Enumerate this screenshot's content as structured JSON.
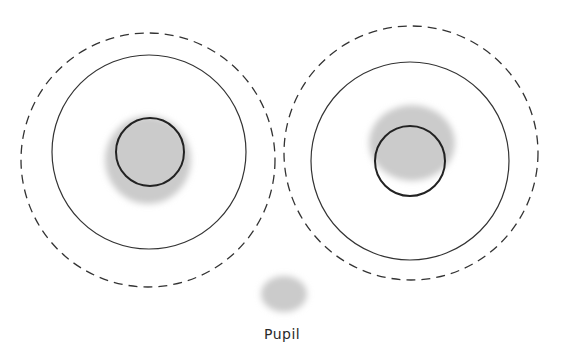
{
  "diagram": {
    "type": "eye-fixation-diagram",
    "colors": {
      "line": "#2a2a2a",
      "shade": "#c9c9c9",
      "background": "#ffffff"
    },
    "left_eye": {
      "dashed_circle": {
        "cx": 148,
        "cy": 160,
        "r": 127
      },
      "solid_circle": {
        "cx": 149,
        "cy": 152,
        "r": 97
      },
      "inner_circle": {
        "cx": 150,
        "cy": 152,
        "r": 34
      },
      "shaded_blob": {
        "cx": 148,
        "cy": 160,
        "rx": 43,
        "ry": 44
      }
    },
    "right_eye": {
      "dashed_circle": {
        "cx": 411,
        "cy": 153,
        "r": 127
      },
      "solid_circle": {
        "cx": 410,
        "cy": 161,
        "r": 99
      },
      "inner_circle": {
        "cx": 410,
        "cy": 161,
        "r": 35
      },
      "shaded_blob": {
        "cx": 412,
        "cy": 143,
        "rx": 43,
        "ry": 38
      }
    },
    "pupil_sample": {
      "cx": 284,
      "cy": 294,
      "rx": 23,
      "ry": 18
    },
    "labels": {
      "pupil": "Pupil"
    }
  }
}
